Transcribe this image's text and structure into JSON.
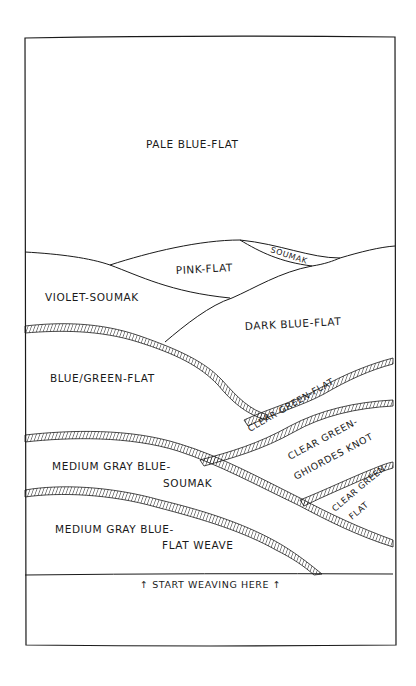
{
  "diagram": {
    "type": "hand-drawn tapestry weaving plan",
    "ink_color": "#1a1a1a",
    "background": "#ffffff",
    "regions": [
      {
        "id": "pale-blue",
        "label": "Pale Blue-Flat"
      },
      {
        "id": "pink",
        "label": "Pink-Flat"
      },
      {
        "id": "soumak-small",
        "label": "Soumak"
      },
      {
        "id": "violet",
        "label": "Violet-Soumak"
      },
      {
        "id": "dark-blue",
        "label": "Dark Blue-Flat"
      },
      {
        "id": "blue-green",
        "label": "Blue/Green-Flat"
      },
      {
        "id": "clear-green-1",
        "label": "Clear Green-Flat"
      },
      {
        "id": "clear-green-knot",
        "label_line1": "Clear Green-",
        "label_line2": "Ghiordes Knot"
      },
      {
        "id": "clear-green-2",
        "label_line1": "Clear Green-",
        "label_line2": "Flat"
      },
      {
        "id": "medium-gray-soumak",
        "label_line1": "Medium Gray Blue-",
        "label_line2": "Soumak"
      },
      {
        "id": "medium-gray-flat",
        "label_line1": "Medium Gray Blue-",
        "label_line2": "Flat Weave"
      }
    ],
    "footer_note": "↑ Start Weaving Here ↑"
  }
}
